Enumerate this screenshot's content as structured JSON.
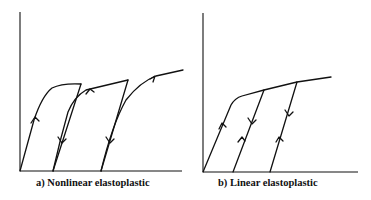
{
  "panels": [
    {
      "id": "a",
      "caption": "a) Nonlinear elastoplastic"
    },
    {
      "id": "b",
      "caption": "b) Linear elastoplastic"
    }
  ]
}
